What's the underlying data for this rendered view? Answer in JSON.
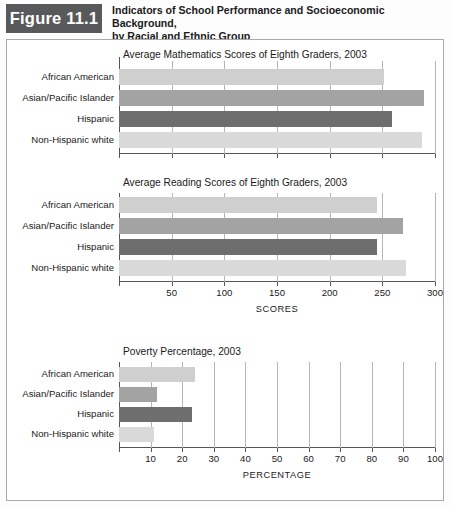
{
  "header": {
    "figure_tag": "Figure 11.1",
    "title_line1": "Indicators of School Performance and Socioeconomic Background,",
    "title_line2": "by Racial and Ethnic Group"
  },
  "colors": {
    "tag_bg": "#58595b",
    "bar_light": "#cfcfcf",
    "bar_medium": "#a3a3a3",
    "bar_dark": "#6e6e6e",
    "bar_lightest": "#d9d9d9",
    "grid": "#b6b6b6",
    "axis": "#555555",
    "frame": "#a9a9a9"
  },
  "categories": [
    "African American",
    "Asian/Pacific Islander",
    "Hispanic",
    "Non-Hispanic white"
  ],
  "chart_data": [
    {
      "type": "bar",
      "orientation": "horizontal",
      "title": "Average Mathematics Scores of Eighth Graders, 2003",
      "categories": [
        "African American",
        "Asian/Pacific Islander",
        "Hispanic",
        "Non-Hispanic white"
      ],
      "values": [
        252,
        290,
        259,
        288
      ],
      "bar_colors": [
        "#cfcfcf",
        "#a3a3a3",
        "#6e6e6e",
        "#d9d9d9"
      ],
      "xlabel": "",
      "ylabel": "",
      "xlim": [
        0,
        300
      ],
      "xticks": [
        0,
        50,
        100,
        150,
        200,
        250,
        300
      ],
      "xtick_labels": [
        "",
        "",
        "",
        "",
        "",
        "",
        ""
      ],
      "grid": true,
      "legend": "none"
    },
    {
      "type": "bar",
      "orientation": "horizontal",
      "title": "Average Reading Scores of Eighth Graders, 2003",
      "categories": [
        "African American",
        "Asian/Pacific Islander",
        "Hispanic",
        "Non-Hispanic white"
      ],
      "values": [
        245,
        270,
        245,
        272
      ],
      "bar_colors": [
        "#cfcfcf",
        "#a3a3a3",
        "#6e6e6e",
        "#d9d9d9"
      ],
      "xlabel": "SCORES",
      "ylabel": "",
      "xlim": [
        0,
        300
      ],
      "xticks": [
        0,
        50,
        100,
        150,
        200,
        250,
        300
      ],
      "xtick_labels": [
        "",
        "50",
        "100",
        "150",
        "200",
        "250",
        "300"
      ],
      "grid": true,
      "legend": "none"
    },
    {
      "type": "bar",
      "orientation": "horizontal",
      "title": "Poverty Percentage, 2003",
      "categories": [
        "African American",
        "Asian/Pacific Islander",
        "Hispanic",
        "Non-Hispanic white"
      ],
      "values": [
        24,
        12,
        23,
        11
      ],
      "bar_colors": [
        "#cfcfcf",
        "#a3a3a3",
        "#6e6e6e",
        "#d9d9d9"
      ],
      "xlabel": "PERCENTAGE",
      "ylabel": "",
      "xlim": [
        0,
        100
      ],
      "xticks": [
        0,
        10,
        20,
        30,
        40,
        50,
        60,
        70,
        80,
        90,
        100
      ],
      "xtick_labels": [
        "",
        "10",
        "20",
        "30",
        "40",
        "50",
        "60",
        "70",
        "80",
        "90",
        "100"
      ],
      "grid": true,
      "legend": "none"
    }
  ]
}
